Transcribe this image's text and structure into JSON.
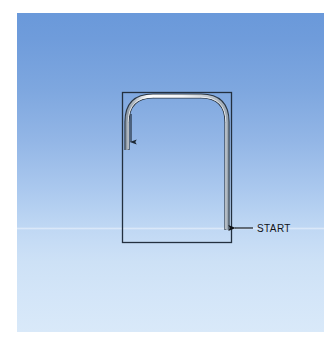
{
  "figure": {
    "name": "tube-start-diagram",
    "background_color": "#ffffff",
    "panel": {
      "name": "sky-gradient-panel",
      "gradient_top_color": "#6a99da",
      "gradient_bottom_color": "#d9e9f9",
      "x": 17,
      "y": 13,
      "width": 307,
      "height": 319
    },
    "outline_rectangle": {
      "name": "reference-rectangle",
      "stroke_color": "#23303f",
      "x": 122,
      "y": 92,
      "width": 110,
      "height": 151
    },
    "tube": {
      "name": "bent-tube",
      "fill_color": "#f4f7fa",
      "edge_color": "#2b3744",
      "corner_radius": 26,
      "left_leg_end_y": 150,
      "right_leg_end_y": 230,
      "top_y": 96,
      "left_x": 127,
      "right_x": 227
    },
    "flow_arrow": {
      "name": "flow-direction-arrow",
      "color": "#1c2733",
      "x": 131,
      "y_start": 114,
      "y_end": 149,
      "direction": "down"
    },
    "start_annotation": {
      "name": "start-callout",
      "label": "START",
      "text_color": "#111418",
      "arrow_color": "#111418",
      "arrow_tip_x": 232,
      "arrow_tail_x": 253,
      "y": 228,
      "text_x": 256
    }
  }
}
